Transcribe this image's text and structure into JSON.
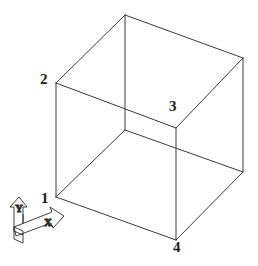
{
  "figure": {
    "title": "",
    "type": "wireframe-cube-oblique-projection",
    "background_color": "#ffffff",
    "line_color": "#3a3a3a",
    "label_color": "#1a1a1a",
    "vertex_labels": [
      {
        "id": "1",
        "text": "1",
        "x": 41,
        "y": 191,
        "vertex_x": 56,
        "vertex_y": 197
      },
      {
        "id": "2",
        "text": "2",
        "x": 40,
        "y": 72,
        "vertex_x": 56,
        "vertex_y": 83
      },
      {
        "id": "3",
        "text": "3",
        "x": 169,
        "y": 99,
        "vertex_x": 176,
        "vertex_y": 128
      },
      {
        "id": "4",
        "text": "4",
        "x": 173,
        "y": 240,
        "vertex_x": 176,
        "vertex_y": 240
      }
    ],
    "axis_indicator": {
      "x_label": "X",
      "y_label": "Y",
      "origin_x": 17,
      "origin_y": 228
    },
    "geometry": {
      "front_bottom_left": [
        56,
        197
      ],
      "front_top_left": [
        56,
        83
      ],
      "top_apex": [
        125,
        15
      ],
      "top_right": [
        243,
        58
      ],
      "right_bottom": [
        243,
        172
      ],
      "bottom_front": [
        176,
        240
      ],
      "inner_vertex": [
        176,
        128
      ],
      "hidden_left_back": [
        56,
        83
      ],
      "note": "Cube drawn in oblique projection; vertical edges are vertical, receding edges slope up-right."
    }
  }
}
